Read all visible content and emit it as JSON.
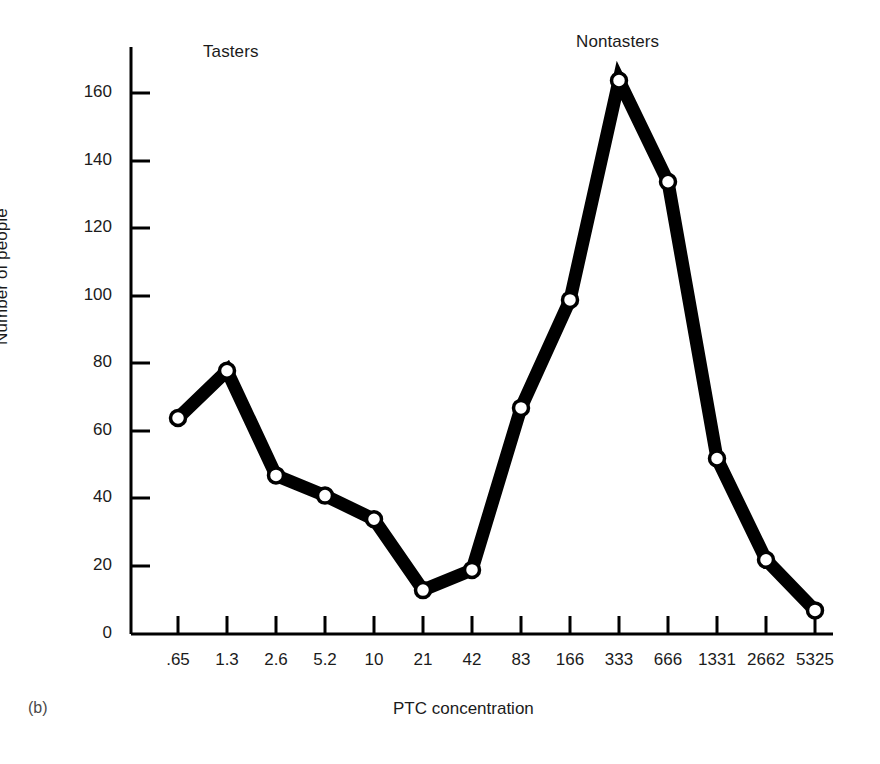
{
  "figure": {
    "panel_letter": "(b)",
    "background_color": "#ffffff",
    "ink_color": "#000000"
  },
  "annotations": [
    {
      "name": "tasters",
      "text": "Tasters"
    },
    {
      "name": "nontasters",
      "text": "Nontasters"
    }
  ],
  "axes": {
    "x_title": "PTC concentration",
    "y_title": "Number of people",
    "y_tick_labels": [
      "160",
      "140",
      "120",
      "100",
      "80",
      "60",
      "40",
      "20",
      "0"
    ],
    "x_tick_labels": [
      ".65",
      "1.3",
      "2.6",
      "5.2",
      "10",
      "21",
      "42",
      "83",
      "166",
      "333",
      "666",
      "1331",
      "2662",
      "5325"
    ]
  },
  "chart_data": {
    "type": "line",
    "title": "",
    "subtitle": "",
    "xlabel": "PTC concentration",
    "ylabel": "Number of people",
    "categories": [
      ".65",
      "1.3",
      "2.6",
      "5.2",
      "10",
      "21",
      "42",
      "83",
      "166",
      "333",
      "666",
      "1331",
      "2662",
      "5325"
    ],
    "values": [
      64,
      78,
      47,
      41,
      34,
      13,
      19,
      67,
      99,
      164,
      134,
      52,
      22,
      7
    ],
    "series": [
      {
        "name": "Number of people",
        "values": [
          64,
          78,
          47,
          41,
          34,
          13,
          19,
          67,
          99,
          164,
          134,
          52,
          22,
          7
        ]
      }
    ],
    "ylim": [
      0,
      172
    ],
    "yticks": [
      0,
      20,
      40,
      60,
      80,
      100,
      120,
      140,
      160
    ],
    "grid": false,
    "legend": false,
    "marker": "open-circle",
    "line_color": "#000000",
    "marker_fill": "#ffffff",
    "annotations": [
      {
        "text": "Tasters",
        "near_category": "1.3"
      },
      {
        "text": "Nontasters",
        "near_category": "333"
      }
    ]
  }
}
